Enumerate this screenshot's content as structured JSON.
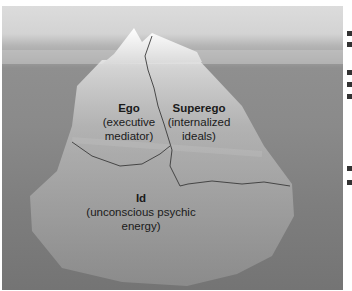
{
  "diagram": {
    "colors": {
      "sky": "#d8d8d8",
      "water": "#858585",
      "ice": "#e6e6e6"
    },
    "labels": [
      {
        "id": "ego",
        "name": "Ego",
        "desc_line1": "(executive",
        "desc_line2": "mediator)"
      },
      {
        "id": "superego",
        "name": "Superego",
        "desc_line1": "(internalized",
        "desc_line2": "ideals)"
      },
      {
        "id": "id",
        "name": "Id",
        "desc_line1": "(unconscious psychic",
        "desc_line2": "energy)"
      }
    ]
  }
}
